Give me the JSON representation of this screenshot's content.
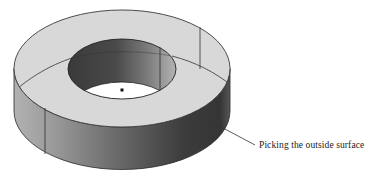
{
  "figure": {
    "annotation": {
      "text": "Picking the outside surface",
      "leader_from": [
        208,
        120
      ],
      "leader_to": [
        255,
        145
      ]
    },
    "colors": {
      "top_face": "#d8d8d8",
      "outer_wall_light": "#a4a4a4",
      "outer_wall_dark": "#383838",
      "inner_wall_dark": "#3e3e3e",
      "inner_wall_light": "#b0b0b0",
      "hole_floor": "#ffffff",
      "edge": "#2a2a2a"
    },
    "geometry": {
      "outer": {
        "cx": 122,
        "cy_top": 68.5,
        "cy_bottom": 111,
        "rx": 108,
        "ry": 58.5
      },
      "inner": {
        "cx": 122,
        "cy_top": 69,
        "cy_bottom": 112,
        "rx": 54,
        "ry": 30
      },
      "center_point": [
        122,
        90
      ]
    }
  }
}
